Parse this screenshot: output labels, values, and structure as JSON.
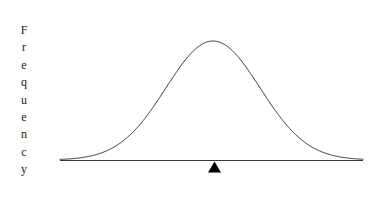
{
  "figure": {
    "background_color": "#ffffff",
    "width": 379,
    "height": 199
  },
  "y_axis": {
    "name": "frequency-axis-label",
    "label": "Frequency",
    "orientation": "vertical-stacked-letters",
    "letters": [
      "F",
      "r",
      "e",
      "q",
      "u",
      "e",
      "n",
      "c",
      "y"
    ],
    "color": "#1a1a1a"
  },
  "marker": {
    "name": "mean-marker-triangle",
    "glyph": "triangle-up",
    "color": "#000000",
    "x_position": 214.5,
    "width": 13,
    "height": 11
  },
  "axis_line": {
    "name": "baseline-axis",
    "color": "#3a3a3a",
    "x_start": 60,
    "x_end": 363,
    "y": 160
  },
  "curve": {
    "name": "normal-distribution-curve",
    "color": "#333333",
    "stroke_width": 1,
    "fill": "none"
  },
  "chart_data": {
    "type": "line",
    "title": "",
    "subtitle": "",
    "xlabel": "",
    "ylabel": "Frequency",
    "grid": false,
    "legend": false,
    "xlim": [
      60,
      363
    ],
    "ylim": [
      0,
      119
    ],
    "annotations": [
      {
        "label": "triangle-marker",
        "x": 214.5,
        "y": 0,
        "symbol": "▲"
      }
    ],
    "series": [
      {
        "name": "Normal distribution",
        "type": "bell-curve",
        "mean_x": 213,
        "peak_y": 41,
        "baseline_y": 160,
        "sigma_px": 47,
        "x": [
          60,
          70,
          80,
          90,
          100,
          110,
          120,
          130,
          140,
          150,
          160,
          170,
          180,
          190,
          200,
          213,
          225,
          235,
          245,
          255,
          265,
          275,
          285,
          295,
          305,
          315,
          325,
          335,
          345,
          355,
          363
        ],
        "y": [
          0.1,
          0.3,
          0.9,
          2.0,
          4.1,
          7.6,
          13.0,
          20.7,
          30.8,
          43.0,
          56.8,
          71.0,
          84.3,
          95.4,
          103.4,
          119.0,
          113.3,
          104.6,
          93.2,
          79.8,
          65.6,
          51.6,
          38.8,
          27.8,
          19.0,
          12.3,
          7.6,
          4.4,
          2.4,
          1.2,
          0.7
        ]
      }
    ]
  }
}
